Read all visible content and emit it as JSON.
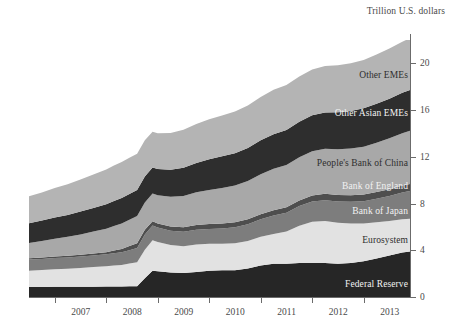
{
  "chart_data": {
    "type": "area",
    "stacked": true,
    "title": "",
    "subtitle": "",
    "xlabel": "",
    "ylabel": "Trillion U.S. dollars",
    "axis_title": "Trillion U.S. dollars",
    "ylim": [
      0,
      22
    ],
    "yticks": [
      0,
      4,
      8,
      12,
      16,
      20
    ],
    "ytick_labels": [
      "0",
      "4",
      "8",
      "12",
      "16",
      "20"
    ],
    "xlim": [
      2006.5,
      2013.9
    ],
    "xticks": [
      2007,
      2008,
      2009,
      2010,
      2011,
      2012,
      2013
    ],
    "xtick_labels": [
      "2007",
      "2008",
      "2009",
      "2010",
      "2011",
      "2012",
      "2013"
    ],
    "grid": false,
    "legend": "inline-labels",
    "x": [
      2006.5,
      2006.75,
      2007.0,
      2007.25,
      2007.5,
      2007.75,
      2008.0,
      2008.15,
      2008.3,
      2008.45,
      2008.6,
      2008.75,
      2008.9,
      2009.0,
      2009.25,
      2009.5,
      2009.75,
      2010.0,
      2010.25,
      2010.5,
      2010.75,
      2011.0,
      2011.25,
      2011.5,
      2011.75,
      2012.0,
      2012.25,
      2012.5,
      2012.75,
      2013.0,
      2013.25,
      2013.5,
      2013.75,
      2013.9
    ],
    "series": [
      {
        "name": "Federal Reserve",
        "color": "#262626",
        "label_color": "light",
        "values": [
          0.85,
          0.86,
          0.87,
          0.87,
          0.88,
          0.88,
          0.89,
          0.9,
          0.9,
          0.91,
          0.92,
          1.6,
          2.25,
          2.2,
          2.1,
          2.05,
          2.15,
          2.25,
          2.3,
          2.3,
          2.45,
          2.7,
          2.85,
          2.85,
          2.9,
          2.9,
          2.9,
          2.85,
          2.9,
          3.05,
          3.3,
          3.55,
          3.8,
          3.9
        ]
      },
      {
        "name": "Eurosystem",
        "color": "#e2e2e2",
        "label_color": "dark",
        "values": [
          1.4,
          1.45,
          1.5,
          1.55,
          1.6,
          1.68,
          1.75,
          1.8,
          1.85,
          1.95,
          2.05,
          2.45,
          2.6,
          2.5,
          2.35,
          2.3,
          2.35,
          2.3,
          2.25,
          2.3,
          2.35,
          2.45,
          2.55,
          2.75,
          3.2,
          3.55,
          3.6,
          3.5,
          3.4,
          3.25,
          3.1,
          2.95,
          2.85,
          2.8
        ]
      },
      {
        "name": "Bank of Japan",
        "color": "#7d7d7d",
        "label_color": "light",
        "values": [
          0.95,
          0.95,
          0.96,
          0.97,
          0.98,
          1.0,
          1.02,
          1.05,
          1.08,
          1.15,
          1.22,
          1.3,
          1.28,
          1.25,
          1.22,
          1.24,
          1.26,
          1.28,
          1.32,
          1.38,
          1.42,
          1.5,
          1.58,
          1.62,
          1.68,
          1.72,
          1.78,
          1.82,
          1.85,
          1.9,
          2.0,
          2.15,
          2.3,
          2.38
        ]
      },
      {
        "name": "Bank of England",
        "color": "#4e4e4e",
        "label_color": "light",
        "values": [
          0.12,
          0.13,
          0.14,
          0.14,
          0.15,
          0.16,
          0.18,
          0.22,
          0.28,
          0.36,
          0.42,
          0.4,
          0.36,
          0.34,
          0.36,
          0.38,
          0.4,
          0.42,
          0.42,
          0.42,
          0.43,
          0.44,
          0.45,
          0.46,
          0.48,
          0.52,
          0.55,
          0.56,
          0.56,
          0.57,
          0.58,
          0.58,
          0.59,
          0.6
        ]
      },
      {
        "name": "People's Bank of China",
        "color": "#a8a8a8",
        "label_color": "dark",
        "values": [
          1.3,
          1.4,
          1.52,
          1.62,
          1.75,
          1.88,
          2.0,
          2.1,
          2.18,
          2.25,
          2.32,
          2.35,
          2.38,
          2.42,
          2.55,
          2.68,
          2.8,
          2.92,
          3.05,
          3.15,
          3.28,
          3.42,
          3.55,
          3.62,
          3.7,
          3.78,
          3.85,
          3.92,
          4.0,
          4.1,
          4.22,
          4.35,
          4.48,
          4.55
        ]
      },
      {
        "name": "Other Asian EMEs",
        "color": "#2e2e2e",
        "label_color": "light",
        "values": [
          1.7,
          1.75,
          1.82,
          1.88,
          1.95,
          2.02,
          2.1,
          2.14,
          2.18,
          2.2,
          2.22,
          2.22,
          2.22,
          2.24,
          2.32,
          2.42,
          2.52,
          2.62,
          2.7,
          2.76,
          2.82,
          2.9,
          2.96,
          3.0,
          3.04,
          3.08,
          3.12,
          3.16,
          3.22,
          3.28,
          3.34,
          3.4,
          3.46,
          3.5
        ]
      },
      {
        "name": "Other EMEs",
        "color": "#b4b4b4",
        "label_color": "dark",
        "values": [
          2.3,
          2.4,
          2.52,
          2.62,
          2.74,
          2.86,
          2.98,
          3.04,
          3.08,
          3.1,
          3.12,
          3.1,
          3.06,
          3.06,
          3.14,
          3.24,
          3.34,
          3.42,
          3.5,
          3.56,
          3.64,
          3.72,
          3.8,
          3.84,
          3.88,
          3.92,
          3.98,
          4.02,
          4.08,
          4.14,
          4.22,
          4.3,
          4.38,
          4.42
        ]
      }
    ],
    "series_label_anchors": [
      {
        "name": "Other EMEs",
        "x_px": 408,
        "y_px": 75
      },
      {
        "name": "Other Asian EMEs",
        "x_px": 408,
        "y_px": 113
      },
      {
        "name": "People's Bank of China",
        "x_px": 408,
        "y_px": 163
      },
      {
        "name": "Bank of England",
        "x_px": 408,
        "y_px": 186
      },
      {
        "name": "Bank of Japan",
        "x_px": 408,
        "y_px": 211
      },
      {
        "name": "Eurosystem",
        "x_px": 408,
        "y_px": 240
      },
      {
        "name": "Federal Reserve",
        "x_px": 408,
        "y_px": 284
      }
    ]
  }
}
